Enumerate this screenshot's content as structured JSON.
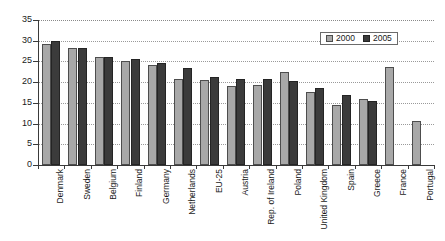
{
  "chart_data": {
    "type": "bar",
    "title": "",
    "subtitle": "",
    "xlabel": "",
    "ylabel": "",
    "ylim": [
      0,
      35
    ],
    "ytick_step": 5,
    "yticks": [
      "35",
      "30",
      "25",
      "20",
      "15",
      "10",
      "5",
      "0"
    ],
    "grid": true,
    "grid_axis": "y",
    "legend_position": "top-right",
    "categories": [
      "Denmark",
      "Sweden",
      "Belgium",
      "Finland",
      "Germany",
      "Netherlands",
      "EU-25",
      "Austria",
      "Rep. of Ireland",
      "Poland",
      "United Kingdom",
      "Spain",
      "Greece",
      "France",
      "Portugal"
    ],
    "series": [
      {
        "name": "2000",
        "color": "#a8a8a8",
        "values": [
          29.1,
          28.2,
          26.1,
          25.2,
          24.2,
          20.7,
          20.6,
          19.0,
          19.4,
          22.5,
          17.7,
          14.4,
          16.0,
          23.7,
          10.6
        ]
      },
      {
        "name": "2005",
        "color": "#3b3b3b",
        "values": [
          30.0,
          28.2,
          26.0,
          25.6,
          24.6,
          23.3,
          21.2,
          20.7,
          20.8,
          20.4,
          18.7,
          17.0,
          15.4,
          null,
          null
        ]
      }
    ]
  },
  "legend": {
    "items": [
      {
        "label": "2000"
      },
      {
        "label": "2005"
      }
    ]
  },
  "colors": {
    "series_2000": "#a8a8a8",
    "series_2005": "#3b3b3b",
    "axis": "#3a3a3a",
    "grid": "#9a9a9a",
    "background": "#ffffff"
  }
}
